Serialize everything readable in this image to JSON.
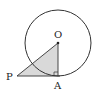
{
  "diagram": {
    "type": "geometry",
    "points": {
      "O": {
        "label": "O",
        "x": 58,
        "y": 43
      },
      "A": {
        "label": "A",
        "x": 58,
        "y": 76
      },
      "P": {
        "label": "P",
        "x": 17,
        "y": 76
      }
    },
    "circle": {
      "center": "O",
      "radius": 33
    },
    "shaded_region": [
      "P",
      "O",
      "A"
    ],
    "right_angle_at": "A",
    "colors": {
      "stroke": "#333333",
      "fill": "#d9d9d9"
    }
  }
}
